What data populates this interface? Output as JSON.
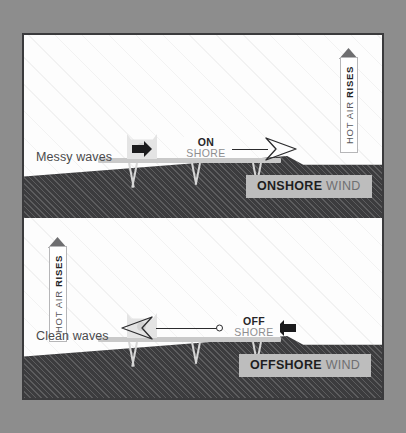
{
  "figure": {
    "background_color": "#8d8d8d",
    "frame_border_color": "#3a3a3c",
    "panel_background": "#fdfdfd",
    "land_color": "#3c3c3e",
    "chip_color": "#bdbdbd",
    "accent_dark": "#1e1e20",
    "accent_muted": "#8e8e90"
  },
  "panels": [
    {
      "id": "onshore",
      "wave_caption": "Messy waves",
      "wind_label": {
        "line1": "ON",
        "line2": "SHORE"
      },
      "wind_chip": {
        "bold": "ONSHORE",
        "light": "WIND"
      },
      "riser": {
        "light": "HOT AIR",
        "bold": "RISES"
      },
      "riser_side": "right",
      "wind_direction": "left-to-right"
    },
    {
      "id": "offshore",
      "wave_caption": "Clean waves",
      "wind_label": {
        "line1": "OFF",
        "line2": "SHORE"
      },
      "wind_chip": {
        "bold": "OFFSHORE",
        "light": "WIND"
      },
      "riser": {
        "light": "HOT AIR",
        "bold": "RISES"
      },
      "riser_side": "left",
      "wind_direction": "right-to-left"
    }
  ]
}
